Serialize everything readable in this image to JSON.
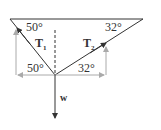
{
  "diagram": {
    "type": "force-diagram",
    "angles": {
      "left_top": "50°",
      "right_top": "32°",
      "left_bottom": "50°",
      "right_bottom": "32°"
    },
    "forces": {
      "t1": {
        "label": "T",
        "subscript": "1"
      },
      "t2": {
        "label": "T",
        "subscript": "2"
      },
      "w": {
        "label": "w"
      }
    },
    "colors": {
      "rope": "#333333",
      "component": "#aaaaaa",
      "text": "#333333"
    }
  }
}
